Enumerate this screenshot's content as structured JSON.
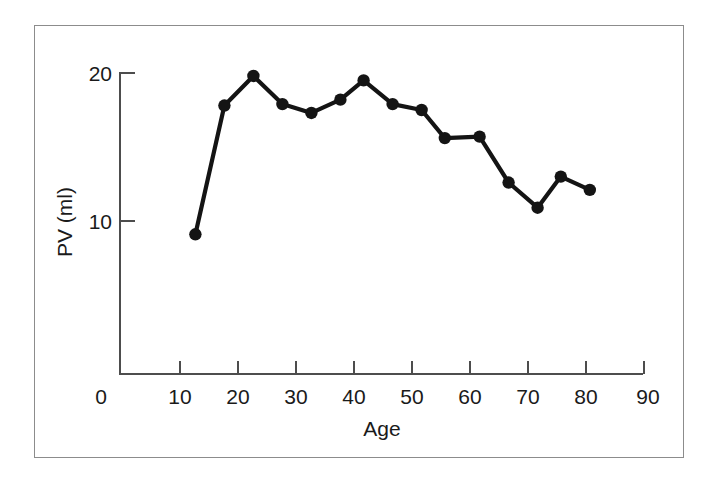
{
  "chart_data": {
    "type": "line",
    "title": "",
    "subtitle": "",
    "xlabel": "Age",
    "ylabel": "PV (ml)",
    "xlim": [
      0,
      90
    ],
    "ylim": [
      0,
      20
    ],
    "xticks": [
      0,
      10,
      20,
      30,
      40,
      50,
      60,
      70,
      80,
      90
    ],
    "xtick_labels": [
      "0",
      "10",
      "20",
      "30",
      "40",
      "50",
      "60",
      "70",
      "80",
      "90"
    ],
    "yticks": [
      10,
      20
    ],
    "ytick_labels": [
      "10",
      "20"
    ],
    "grid": false,
    "legend": false,
    "legend_position": "none",
    "marker": "filled-circle",
    "line_color": "#141414",
    "marker_color": "#141414",
    "axis_color": "#4d4d4d",
    "frame_color": "#8c8c8c",
    "background": "#ffffff",
    "series": [
      {
        "name": "PV",
        "x": [
          13,
          18,
          23,
          28,
          33,
          38,
          42,
          47,
          52,
          56,
          62,
          67,
          72,
          76,
          81
        ],
        "values": [
          9.1,
          17.8,
          19.8,
          17.9,
          17.3,
          18.2,
          19.5,
          17.9,
          17.5,
          15.6,
          15.7,
          12.6,
          10.9,
          13.0,
          12.1
        ]
      }
    ]
  },
  "axes": {
    "y_axis_label": "PV (ml)",
    "x_axis_label": "Age",
    "origin_label": "0"
  }
}
